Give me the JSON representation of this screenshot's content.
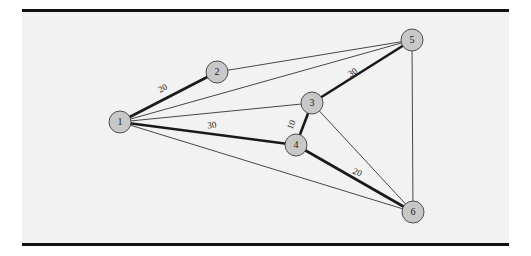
{
  "figure": {
    "name": "weighted-undirected-graph",
    "background_color": "#f2f2f2",
    "page_color": "#ffffff",
    "rule_color": "#111111",
    "node_fill": "#c8c8c8",
    "node_stroke": "#4d4d4d",
    "edge_color": "#1a1a1a",
    "thin_edge_width": 0.8,
    "thick_edge_width": 2.6
  },
  "chart_data": {
    "type": "diagram",
    "subtype": "node-link-graph",
    "title": "",
    "directed": false,
    "weighted": true,
    "nodes": [
      {
        "id": "1",
        "label": "1",
        "x": 120,
        "y": 122,
        "r": 11
      },
      {
        "id": "2",
        "label": "2",
        "x": 217,
        "y": 72,
        "r": 11
      },
      {
        "id": "3",
        "label": "3",
        "x": 312,
        "y": 103,
        "r": 11
      },
      {
        "id": "4",
        "label": "4",
        "x": 296,
        "y": 145,
        "r": 11
      },
      {
        "id": "5",
        "label": "5",
        "x": 412,
        "y": 40,
        "r": 11
      },
      {
        "id": "6",
        "label": "6",
        "x": 413,
        "y": 212,
        "r": 11
      }
    ],
    "edges": [
      {
        "source": "1",
        "target": "2",
        "weight": "20",
        "highlighted": true,
        "label_x": 163,
        "label_y": 89,
        "label_rotation": -27
      },
      {
        "source": "1",
        "target": "3",
        "weight": "",
        "highlighted": false,
        "label_x": 0,
        "label_y": 0,
        "label_rotation": 0
      },
      {
        "source": "1",
        "target": "4",
        "weight": "30",
        "highlighted": true,
        "label_x": 212,
        "label_y": 126,
        "label_rotation": -7
      },
      {
        "source": "1",
        "target": "5",
        "weight": "",
        "highlighted": false,
        "label_x": 0,
        "label_y": 0,
        "label_rotation": 0
      },
      {
        "source": "1",
        "target": "6",
        "weight": "",
        "highlighted": false,
        "label_x": 0,
        "label_y": 0,
        "label_rotation": 0
      },
      {
        "source": "2",
        "target": "5",
        "weight": "",
        "highlighted": false,
        "label_x": 0,
        "label_y": 0,
        "label_rotation": 0
      },
      {
        "source": "3",
        "target": "4",
        "weight": "10",
        "highlighted": true,
        "label_x": 292,
        "label_y": 125,
        "label_rotation": -68
      },
      {
        "source": "3",
        "target": "5",
        "weight": "30",
        "highlighted": true,
        "label_x": 353,
        "label_y": 73,
        "label_rotation": -32
      },
      {
        "source": "3",
        "target": "6",
        "weight": "",
        "highlighted": false,
        "label_x": 0,
        "label_y": 0,
        "label_rotation": 0
      },
      {
        "source": "4",
        "target": "6",
        "weight": "20",
        "highlighted": true,
        "label_x": 357,
        "label_y": 173,
        "label_rotation": 25
      },
      {
        "source": "5",
        "target": "6",
        "weight": "",
        "highlighted": false,
        "label_x": 0,
        "label_y": 0,
        "label_rotation": 0
      }
    ],
    "legend": [],
    "annotations": []
  }
}
